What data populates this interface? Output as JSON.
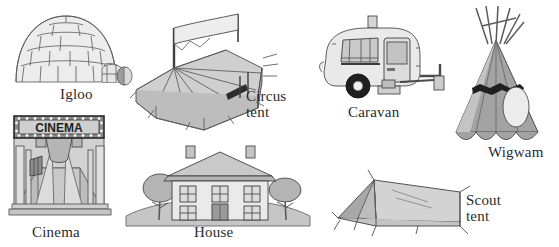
{
  "page": {
    "background_color": "#ffffff",
    "ink_color": "#2b2b2b"
  },
  "palette": {
    "outline": "#5a5a5a",
    "outline_dark": "#3d3d3d",
    "fill_lightest": "#f2f2f2",
    "fill_light": "#e4e4e4",
    "fill_mid": "#cccccc",
    "fill_mid_dark": "#b0b0b0",
    "fill_dark": "#9a9a9a",
    "fill_darker": "#808080",
    "fill_deep": "#6b6b6b",
    "accent_black": "#1a1a1a"
  },
  "figures": [
    {
      "id": "igloo",
      "label": "Igloo",
      "label_lines": [
        "Igloo"
      ],
      "signs": [],
      "parts": [
        "dome",
        "snow-blocks",
        "entrance-tunnel",
        "tunnel-opening"
      ]
    },
    {
      "id": "circus-tent",
      "label": "Circus\ntent",
      "label_lines": [
        "Circus",
        "tent"
      ],
      "signs": [
        "CIRCUS"
      ],
      "parts": [
        "big-top-roof",
        "flag-banner",
        "pole",
        "side-wall",
        "guy-ropes",
        "entrance"
      ]
    },
    {
      "id": "caravan",
      "label": "Caravan",
      "label_lines": [
        "Caravan"
      ],
      "signs": [],
      "parts": [
        "body",
        "roof-vent",
        "front-window",
        "side-window",
        "door",
        "wheel",
        "tow-hitch",
        "support-leg"
      ]
    },
    {
      "id": "wigwam",
      "label": "Wigwam",
      "label_lines": [
        "Wigwam"
      ],
      "signs": [],
      "parts": [
        "cone-cover",
        "crossed-poles",
        "dark-band",
        "oval-entrance",
        "scalloped-hem"
      ]
    },
    {
      "id": "cinema",
      "label": "Cinema",
      "label_lines": [
        "Cinema"
      ],
      "signs": [
        "CINEMA"
      ],
      "parts": [
        "marquee-sign",
        "light-bulbs",
        "facade-columns",
        "entrance-steps",
        "poster-board",
        "projector-beam"
      ]
    },
    {
      "id": "house",
      "label": "House",
      "label_lines": [
        "House"
      ],
      "signs": [],
      "parts": [
        "roof",
        "chimney-left",
        "chimney-right",
        "upper-windows",
        "lower-windows",
        "front-door",
        "tree-left",
        "tree-right",
        "ground"
      ]
    },
    {
      "id": "scout-tent",
      "label": "Scout\ntent",
      "label_lines": [
        "Scout",
        "tent"
      ],
      "signs": [],
      "parts": [
        "ridge-roof",
        "end-flap",
        "guy-ropes",
        "ground-sheet",
        "pole"
      ]
    }
  ]
}
